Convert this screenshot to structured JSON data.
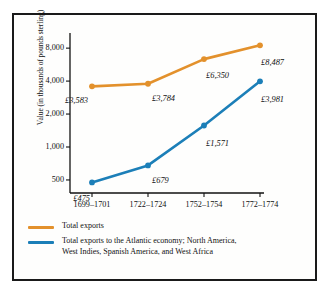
{
  "chart_data": {
    "type": "line",
    "title": "",
    "xlabel": "",
    "ylabel": "Value (in thousands of pounds sterling)",
    "yscale": "log",
    "ylim": [
      380,
      11000
    ],
    "grid": false,
    "legend_position": "bottom-left",
    "categories": [
      "1699–1701",
      "1722–1724",
      "1752–1754",
      "1772–1774"
    ],
    "yticks": [
      500,
      1000,
      2000,
      4000,
      8000
    ],
    "ytick_labels": [
      "500",
      "1,000",
      "2,000",
      "4,000",
      "8,000"
    ],
    "series": [
      {
        "name": "Total exports",
        "color": "#E3912C",
        "values": [
          3583,
          3784,
          6350,
          8487
        ],
        "point_labels": [
          "£3,583",
          "£3,784",
          "£6,350",
          "£8,487"
        ]
      },
      {
        "name": "Total exports to the Atlantic economy; North America, West Indies, Spanish America, and West Africa",
        "color": "#1C7FB8",
        "values": [
          475,
          679,
          1571,
          3981
        ],
        "point_labels": [
          "£475",
          "£679",
          "£1,571",
          "£3,981"
        ]
      }
    ]
  },
  "legend": {
    "items": [
      {
        "label": "Total exports",
        "color": "#E3912C"
      },
      {
        "label": "Total exports to the Atlantic economy; North America,",
        "label2": "West Indies, Spanish America, and West Africa",
        "color": "#1C7FB8"
      }
    ]
  }
}
